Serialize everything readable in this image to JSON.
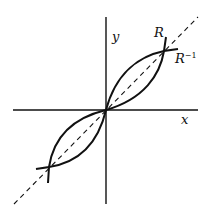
{
  "diagram": {
    "axes": {
      "x_label": "x",
      "y_label": "y"
    },
    "curves": [
      {
        "name": "R",
        "label": "R"
      },
      {
        "name": "R-inverse",
        "label": "R",
        "superscript": "−1"
      }
    ],
    "reference_line": {
      "name": "y=x",
      "style": "dashed"
    },
    "colors": {
      "ink": "#111111",
      "background": "#ffffff"
    }
  }
}
